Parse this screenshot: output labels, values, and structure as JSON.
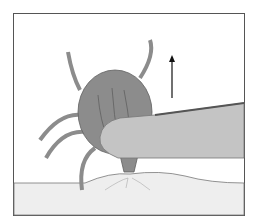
{
  "figure": {
    "elements": [
      "frame",
      "skin",
      "tick",
      "tweezers",
      "upward-arrow"
    ],
    "colors": {
      "background": "#ffffff",
      "frame": "#555555",
      "skin": "#eeeeee",
      "tick_body": "#8c8c8c",
      "tick_outline": "#606060",
      "tweezers": "#c4c4c4",
      "arrow": "#111111"
    }
  }
}
